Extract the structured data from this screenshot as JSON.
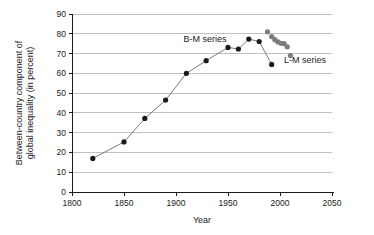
{
  "chart_data": {
    "type": "line",
    "title": "",
    "xlabel": "Year",
    "ylabel": "Between-country component of global inequality (in percent)",
    "ylabel_line1": "Between-country component of",
    "ylabel_line2": "global inequality (in percent)",
    "xlim": [
      1800,
      2050
    ],
    "ylim": [
      0,
      90
    ],
    "xticks": [
      1800,
      1850,
      1900,
      1950,
      2000,
      2050
    ],
    "yticks": [
      0,
      10,
      20,
      30,
      40,
      50,
      60,
      70,
      80,
      90
    ],
    "grid": "horizontal",
    "legend_position": "inline-annotations",
    "series": [
      {
        "name": "B-M series",
        "marker": "filled-circle",
        "color": "#1a1a1a",
        "line_color": "#6b6b6b",
        "connected": true,
        "annotation_label": "B-M series",
        "points": [
          {
            "x": 1820,
            "y": 17.0
          },
          {
            "x": 1850,
            "y": 25.3
          },
          {
            "x": 1870,
            "y": 37.2
          },
          {
            "x": 1890,
            "y": 46.5
          },
          {
            "x": 1910,
            "y": 60.0
          },
          {
            "x": 1929,
            "y": 66.4
          },
          {
            "x": 1950,
            "y": 73.1
          },
          {
            "x": 1960,
            "y": 72.3
          },
          {
            "x": 1970,
            "y": 77.3
          },
          {
            "x": 1980,
            "y": 76.1
          },
          {
            "x": 1992,
            "y": 64.5
          }
        ]
      },
      {
        "name": "L-M series",
        "marker": "filled-circle",
        "color": "#7d7d7d",
        "line_color": "none",
        "connected": false,
        "annotation_label": "L-M series",
        "points": [
          {
            "x": 1988,
            "y": 81.0
          },
          {
            "x": 1992,
            "y": 78.6
          },
          {
            "x": 1995,
            "y": 77.0
          },
          {
            "x": 1998,
            "y": 75.9
          },
          {
            "x": 2001,
            "y": 75.2
          },
          {
            "x": 2004,
            "y": 75.0
          },
          {
            "x": 2007,
            "y": 73.4
          },
          {
            "x": 2010,
            "y": 69.0
          }
        ]
      }
    ],
    "annotations": [
      {
        "text": "B-M series",
        "x": 1928,
        "y": 77.5
      },
      {
        "text": "L-M series",
        "x": 2024,
        "y": 66.5
      }
    ]
  }
}
